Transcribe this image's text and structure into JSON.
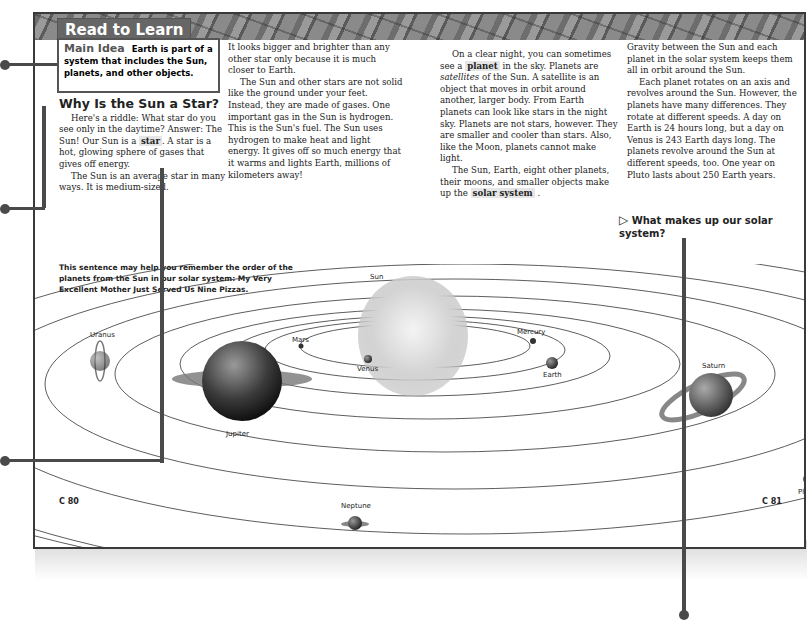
{
  "banner": {
    "title": "Read to Learn"
  },
  "main_idea": {
    "label": "Main Idea",
    "text": "Earth is part of a system that includes the Sun, planets, and other objects."
  },
  "column1": {
    "heading": "Why Is the Sun a Star?",
    "p1_a": "Here's a riddle: What star do you see only in the daytime? Answer: The Sun! Our Sun is a ",
    "p1_vocab": "star",
    "p1_b": ". A star is a hot, glowing sphere of gases that gives off energy.",
    "p2": "The Sun is an average star in many ways. It is medium-sized."
  },
  "mnemonic": "This sentence may help you remember the order of the planets from the Sun in our solar system: My Very Excellent Mother Just Served Us Nine Pizzas.",
  "column2": {
    "p1": "It looks bigger and brighter than any other star only because it is much closer to Earth.",
    "p2": "The Sun and other stars are not solid like the ground under your feet. Instead, they are made of gases. One important gas in the Sun is hydrogen. This is the Sun's fuel. The Sun uses hydrogen to make heat and light energy. It gives off so much energy that it warms and lights Earth, millions of kilometers away!"
  },
  "column3": {
    "p1_a": "On a clear night, you can sometimes see a ",
    "p1_vocab": "planet",
    "p1_b": " in the sky. Planets are ",
    "p1_italic": "satellites",
    "p1_c": " of the Sun. A satellite is an object that moves in orbit around another, larger body. From Earth planets can look like stars in the night sky. Planets are not stars, however. They are smaller and cooler than stars. Also, like the Moon, planets cannot make light.",
    "p2_a": "The Sun, Earth, eight other planets, their moons, and smaller objects make up the ",
    "p2_vocab": "solar system",
    "p2_b": " ."
  },
  "column4": {
    "p1": "Gravity between the Sun and each planet in the solar system keeps them all in orbit around the Sun.",
    "p2": "Each planet rotates on an axis and revolves around the Sun. However, the planets have many differences. They rotate at different speeds. A day on Earth is 24 hours long, but a day on Venus is 243 Earth days long. The planets revolve around the Sun at different speeds, too. One year on Pluto lasts about 250 Earth years.",
    "question": "What makes up our solar system?",
    "question_icon": "triangle-arrow-icon"
  },
  "diagram": {
    "labels": {
      "sun": "Sun",
      "mercury": "Mercury",
      "venus": "Venus",
      "earth": "Earth",
      "mars": "Mars",
      "jupiter": "Jupiter",
      "saturn": "Saturn",
      "uranus": "Uranus",
      "neptune": "Neptune",
      "pluto": "Pluto"
    }
  },
  "page_numbers": {
    "left": "C 80",
    "right": "C 81"
  },
  "colors": {
    "banner": "#666666",
    "callout": "#4a4a4a",
    "border": "#3a3a3a"
  }
}
